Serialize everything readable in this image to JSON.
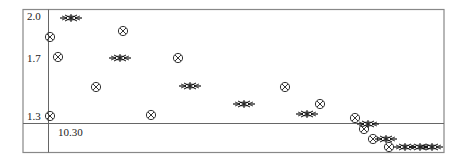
{
  "chart_data": {
    "type": "scatter",
    "title": "",
    "xlabel": "",
    "ylabel": "",
    "y_ticks": [
      "2.0",
      "1.7",
      "1.3"
    ],
    "x_ticks": [
      "10.30"
    ],
    "ylim": [
      1.2,
      2.03
    ],
    "grid": false,
    "legend": null,
    "series": [
      {
        "name": "circle-x markers",
        "marker": "circled-x",
        "points_px": [
          [
            50,
            37
          ],
          [
            58,
            57
          ],
          [
            96,
            87
          ],
          [
            123,
            31
          ],
          [
            151,
            115
          ],
          [
            178,
            58
          ],
          [
            285,
            87
          ],
          [
            320,
            104
          ],
          [
            355,
            118
          ],
          [
            364,
            129
          ],
          [
            373,
            139
          ],
          [
            389,
            147
          ],
          [
            50,
            116
          ]
        ],
        "y_values": [
          1.85,
          1.71,
          1.5,
          1.89,
          1.29,
          1.7,
          1.5,
          1.38,
          1.28,
          1.21,
          1.14,
          1.08,
          1.3
        ]
      },
      {
        "name": "star markers",
        "marker": "star",
        "points_px": [
          [
            71,
            18
          ],
          [
            120,
            58
          ],
          [
            190,
            86
          ],
          [
            244,
            104
          ],
          [
            307,
            114
          ],
          [
            368,
            124
          ],
          [
            386,
            139
          ],
          [
            405,
            147
          ],
          [
            420,
            147
          ],
          [
            432,
            147
          ]
        ],
        "y_values": [
          1.99,
          1.7,
          1.5,
          1.37,
          1.3,
          1.23,
          1.12,
          1.06,
          1.06,
          1.06
        ]
      }
    ]
  },
  "axes": {
    "y_tick_labels": [
      {
        "label": "2.0",
        "y": 16
      },
      {
        "label": "1.7",
        "y": 58
      },
      {
        "label": "1.3",
        "y": 116
      }
    ],
    "x_tick_labels": [
      {
        "label": "10.30",
        "x": 58
      }
    ]
  }
}
